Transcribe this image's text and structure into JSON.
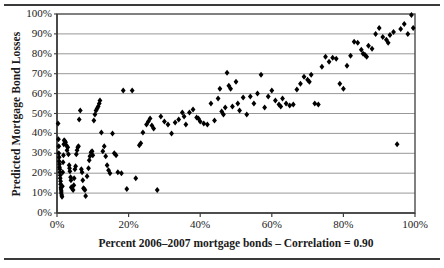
{
  "figure": {
    "top_rule": "horizontal-rule",
    "bottom_rule": "horizontal-rule"
  },
  "chart_data": {
    "type": "scatter",
    "title": "",
    "xlabel": "Percent 2006–2007 mortgage bonds – Correlation = 0.90",
    "ylabel": "Predicted Mortgage Bond Losses",
    "xlim": [
      0,
      100
    ],
    "ylim": [
      0,
      100
    ],
    "xticks": [
      0,
      20,
      40,
      60,
      80,
      100
    ],
    "xtick_labels": [
      "0%",
      "20%",
      "40%",
      "60%",
      "80%",
      "100%"
    ],
    "yticks": [
      0,
      10,
      20,
      30,
      40,
      50,
      60,
      70,
      80,
      90,
      100
    ],
    "ytick_labels": [
      "0%",
      "10%",
      "20%",
      "30%",
      "40%",
      "50%",
      "60%",
      "70%",
      "80%",
      "90%",
      "100%"
    ],
    "grid": "horizontal",
    "legend": null,
    "annotations": [],
    "correlation": 0.9,
    "marker": "diamond",
    "marker_color": "#000000",
    "points": [
      [
        0.3,
        45.0
      ],
      [
        0.4,
        37.0
      ],
      [
        0.5,
        33.5
      ],
      [
        0.5,
        30.0
      ],
      [
        0.6,
        28.0
      ],
      [
        0.6,
        26.0
      ],
      [
        0.7,
        24.5
      ],
      [
        0.7,
        23.0
      ],
      [
        0.8,
        22.0
      ],
      [
        0.8,
        20.5
      ],
      [
        0.9,
        19.0
      ],
      [
        0.9,
        17.5
      ],
      [
        1.0,
        16.0
      ],
      [
        1.0,
        14.5
      ],
      [
        1.1,
        13.0
      ],
      [
        1.1,
        12.0
      ],
      [
        1.2,
        11.0
      ],
      [
        1.2,
        10.0
      ],
      [
        1.3,
        9.0
      ],
      [
        1.4,
        8.2
      ],
      [
        1.5,
        13.5
      ],
      [
        1.6,
        20.5
      ],
      [
        1.7,
        25.5
      ],
      [
        1.8,
        29.0
      ],
      [
        1.9,
        34.5
      ],
      [
        2.0,
        36.5
      ],
      [
        2.2,
        36.0
      ],
      [
        2.4,
        35.5
      ],
      [
        2.6,
        34.0
      ],
      [
        2.8,
        31.5
      ],
      [
        3.0,
        33.0
      ],
      [
        3.2,
        29.5
      ],
      [
        3.4,
        24.0
      ],
      [
        3.5,
        22.5
      ],
      [
        3.6,
        21.0
      ],
      [
        3.8,
        18.0
      ],
      [
        3.9,
        16.5
      ],
      [
        4.0,
        13.0
      ],
      [
        4.2,
        12.5
      ],
      [
        4.5,
        11.5
      ],
      [
        4.7,
        14.0
      ],
      [
        4.8,
        17.5
      ],
      [
        5.0,
        22.0
      ],
      [
        5.2,
        23.5
      ],
      [
        5.4,
        29.5
      ],
      [
        5.6,
        31.5
      ],
      [
        5.8,
        33.0
      ],
      [
        6.0,
        33.5
      ],
      [
        6.2,
        47.0
      ],
      [
        6.5,
        51.5
      ],
      [
        6.8,
        22.0
      ],
      [
        7.0,
        20.5
      ],
      [
        7.2,
        16.5
      ],
      [
        7.4,
        12.5
      ],
      [
        7.6,
        12.0
      ],
      [
        7.8,
        11.5
      ],
      [
        8.0,
        8.5
      ],
      [
        8.4,
        18.5
      ],
      [
        8.8,
        22.5
      ],
      [
        9.0,
        26.5
      ],
      [
        9.2,
        28.5
      ],
      [
        9.5,
        30.5
      ],
      [
        9.8,
        31.0
      ],
      [
        10.0,
        29.0
      ],
      [
        10.3,
        46.5
      ],
      [
        10.6,
        49.5
      ],
      [
        10.9,
        51.5
      ],
      [
        11.2,
        52.5
      ],
      [
        11.5,
        53.5
      ],
      [
        11.8,
        55.0
      ],
      [
        12.0,
        56.5
      ],
      [
        12.4,
        40.5
      ],
      [
        12.8,
        31.0
      ],
      [
        13.2,
        33.5
      ],
      [
        13.6,
        28.5
      ],
      [
        14.0,
        24.0
      ],
      [
        14.4,
        21.5
      ],
      [
        14.8,
        20.0
      ],
      [
        15.5,
        40.0
      ],
      [
        16.0,
        30.0
      ],
      [
        16.5,
        29.0
      ],
      [
        17.0,
        20.5
      ],
      [
        18.0,
        20.0
      ],
      [
        18.5,
        61.5
      ],
      [
        19.5,
        12.0
      ],
      [
        21.0,
        61.5
      ],
      [
        22.0,
        17.5
      ],
      [
        23.0,
        34.0
      ],
      [
        23.4,
        35.0
      ],
      [
        24.0,
        40.5
      ],
      [
        25.0,
        44.5
      ],
      [
        25.5,
        46.0
      ],
      [
        26.0,
        47.5
      ],
      [
        26.5,
        44.0
      ],
      [
        27.0,
        42.5
      ],
      [
        28.0,
        11.5
      ],
      [
        29.0,
        48.5
      ],
      [
        30.0,
        46.0
      ],
      [
        31.0,
        44.5
      ],
      [
        32.0,
        40.0
      ],
      [
        33.0,
        45.5
      ],
      [
        34.0,
        47.0
      ],
      [
        35.0,
        50.5
      ],
      [
        35.5,
        48.5
      ],
      [
        36.0,
        44.5
      ],
      [
        37.0,
        50.5
      ],
      [
        38.0,
        52.0
      ],
      [
        39.0,
        48.0
      ],
      [
        39.5,
        47.5
      ],
      [
        40.0,
        46.0
      ],
      [
        41.0,
        45.0
      ],
      [
        42.0,
        44.5
      ],
      [
        43.0,
        55.0
      ],
      [
        44.0,
        46.5
      ],
      [
        45.0,
        57.5
      ],
      [
        45.5,
        62.5
      ],
      [
        46.0,
        51.0
      ],
      [
        46.5,
        49.5
      ],
      [
        47.0,
        53.0
      ],
      [
        47.5,
        70.5
      ],
      [
        48.0,
        64.0
      ],
      [
        48.5,
        62.5
      ],
      [
        49.0,
        53.5
      ],
      [
        50.0,
        66.0
      ],
      [
        50.5,
        55.0
      ],
      [
        51.0,
        51.5
      ],
      [
        52.0,
        58.0
      ],
      [
        53.0,
        49.5
      ],
      [
        54.0,
        58.5
      ],
      [
        55.0,
        55.0
      ],
      [
        56.0,
        60.0
      ],
      [
        57.0,
        69.5
      ],
      [
        58.0,
        53.0
      ],
      [
        59.0,
        58.5
      ],
      [
        60.0,
        61.5
      ],
      [
        61.0,
        56.5
      ],
      [
        62.0,
        54.5
      ],
      [
        62.5,
        53.5
      ],
      [
        63.0,
        57.5
      ],
      [
        64.0,
        55.0
      ],
      [
        65.0,
        54.0
      ],
      [
        66.0,
        54.5
      ],
      [
        67.0,
        62.0
      ],
      [
        68.0,
        65.0
      ],
      [
        69.0,
        68.5
      ],
      [
        70.0,
        67.0
      ],
      [
        70.5,
        66.0
      ],
      [
        71.0,
        69.5
      ],
      [
        72.0,
        55.0
      ],
      [
        73.0,
        54.5
      ],
      [
        74.0,
        73.5
      ],
      [
        75.0,
        78.5
      ],
      [
        76.0,
        76.0
      ],
      [
        77.0,
        78.0
      ],
      [
        78.0,
        77.5
      ],
      [
        79.0,
        65.0
      ],
      [
        80.0,
        62.5
      ],
      [
        81.0,
        74.0
      ],
      [
        82.0,
        79.0
      ],
      [
        83.0,
        86.0
      ],
      [
        84.0,
        85.5
      ],
      [
        85.0,
        82.0
      ],
      [
        85.5,
        80.0
      ],
      [
        86.0,
        79.5
      ],
      [
        86.5,
        78.5
      ],
      [
        87.0,
        84.0
      ],
      [
        88.0,
        82.5
      ],
      [
        89.0,
        90.0
      ],
      [
        90.0,
        93.0
      ],
      [
        91.0,
        88.5
      ],
      [
        92.0,
        87.0
      ],
      [
        92.5,
        85.5
      ],
      [
        93.0,
        89.5
      ],
      [
        94.0,
        91.0
      ],
      [
        95.0,
        34.5
      ],
      [
        96.0,
        92.5
      ],
      [
        97.0,
        95.0
      ],
      [
        98.0,
        90.0
      ],
      [
        99.0,
        99.5
      ],
      [
        99.5,
        93.0
      ]
    ]
  },
  "ui": {
    "y_axis_title": "Predicted Mortgage Bond Losses",
    "x_axis_title": "Percent 2006–2007 mortgage bonds – Correlation = 0.90"
  }
}
